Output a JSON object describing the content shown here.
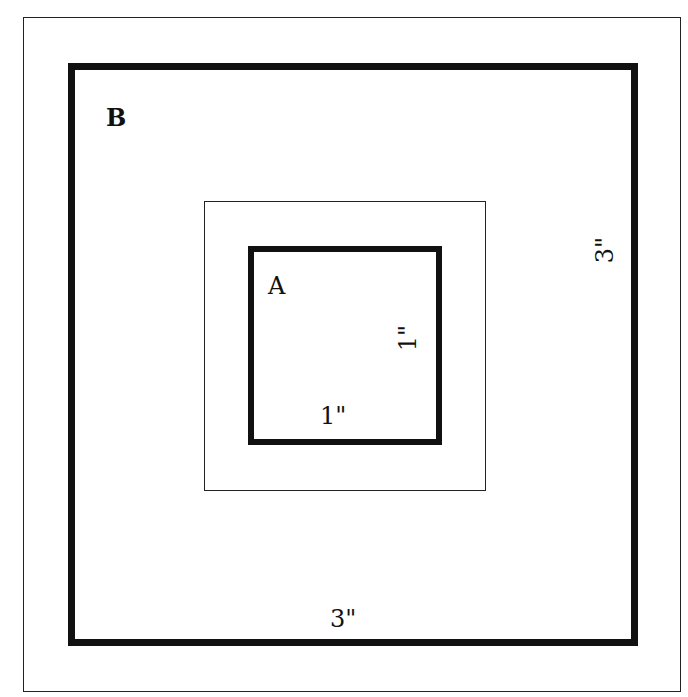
{
  "diagram": {
    "type": "nested-squares",
    "shapes": [
      {
        "id": "outer-frame",
        "role": "frame",
        "stroke": "thin"
      },
      {
        "id": "square-b",
        "label": "B",
        "side_label": "3\"",
        "bottom_label": "3\"",
        "stroke": "thick"
      },
      {
        "id": "middle-square",
        "stroke": "thin"
      },
      {
        "id": "square-a",
        "label": "A",
        "side_label": "1\"",
        "bottom_label": "1\"",
        "stroke": "thick"
      }
    ]
  },
  "labels": {
    "b": "B",
    "a": "A",
    "b_side": "3\"",
    "b_bottom": "3\"",
    "a_side": "1\"",
    "a_bottom": "1\""
  },
  "colors": {
    "stroke": "#111111",
    "background": "#ffffff"
  }
}
